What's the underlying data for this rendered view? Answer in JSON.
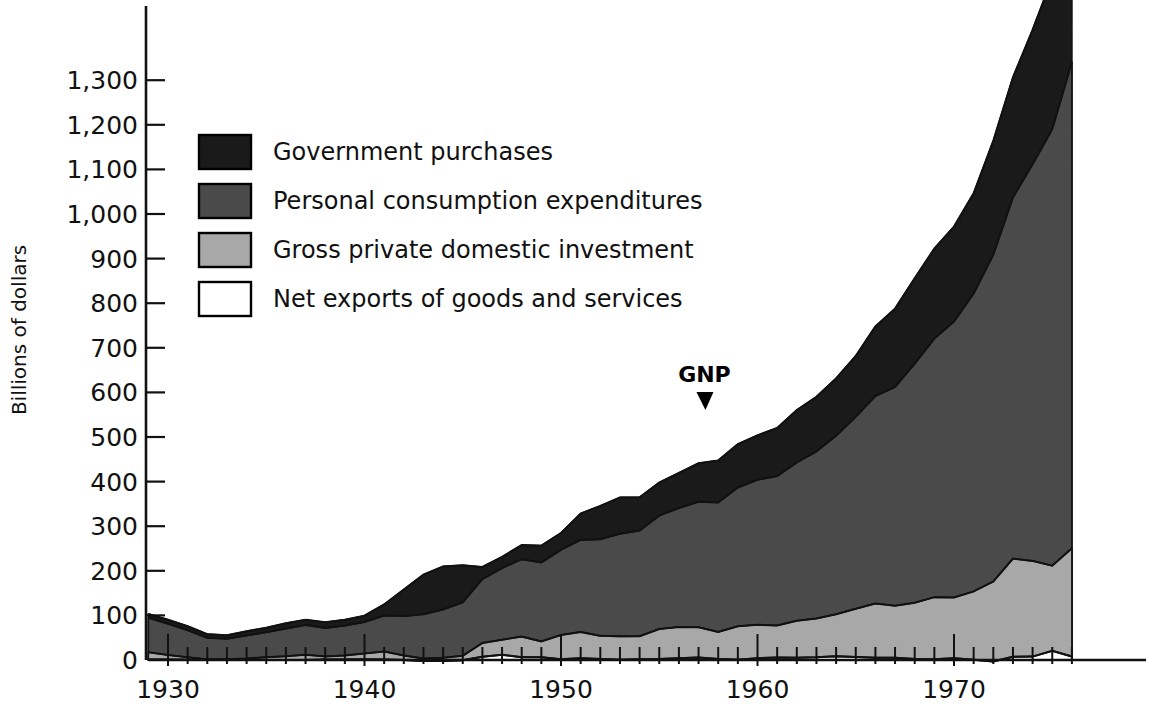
{
  "chart_data": {
    "type": "area",
    "stacked": true,
    "title": "",
    "xlabel": "",
    "ylabel": "Billions of dollars",
    "xlim": [
      1929,
      1976
    ],
    "ylim": [
      0,
      1400
    ],
    "grid": false,
    "legend_position": "upper-left-inside",
    "y_ticks": [
      0,
      100,
      200,
      300,
      400,
      500,
      600,
      700,
      800,
      900,
      1000,
      1100,
      1200,
      1300
    ],
    "y_tick_labels": [
      "0",
      "100",
      "200",
      "300",
      "400",
      "500",
      "600",
      "700",
      "800",
      "900",
      "1,000",
      "1,100",
      "1,200",
      "1,300"
    ],
    "x_ticks": [
      1930,
      1940,
      1950,
      1960,
      1970
    ],
    "x_tick_labels": [
      "1930",
      "1940",
      "1950",
      "1960",
      "1970"
    ],
    "x_minor_tick_interval": 1,
    "x": [
      1929,
      1930,
      1931,
      1932,
      1933,
      1934,
      1935,
      1936,
      1937,
      1938,
      1939,
      1940,
      1941,
      1942,
      1943,
      1944,
      1945,
      1946,
      1947,
      1948,
      1949,
      1950,
      1951,
      1952,
      1953,
      1954,
      1955,
      1956,
      1957,
      1958,
      1959,
      1960,
      1961,
      1962,
      1963,
      1964,
      1965,
      1966,
      1967,
      1968,
      1969,
      1970,
      1971,
      1972,
      1973,
      1974,
      1975,
      1976
    ],
    "series": [
      {
        "name": "Net exports of goods and services",
        "swatch": "#ffffff",
        "stack_order": 1,
        "values": [
          1.1,
          1.0,
          0.5,
          0.4,
          0.4,
          0.6,
          0.1,
          0.1,
          0.1,
          1.1,
          1.0,
          1.5,
          1.0,
          0.0,
          -2.2,
          -2.0,
          -0.8,
          7.5,
          11.5,
          6.4,
          6.1,
          1.8,
          3.7,
          2.2,
          0.4,
          1.8,
          2.0,
          4.0,
          5.7,
          2.2,
          0.3,
          4.1,
          5.6,
          5.1,
          5.9,
          8.5,
          6.9,
          5.3,
          5.2,
          2.5,
          1.9,
          3.9,
          0.6,
          -3.4,
          7.1,
          7.6,
          20.4,
          7.8
        ]
      },
      {
        "name": "Gross private domestic investment",
        "swatch": "#a8a8a8",
        "stack_order": 2,
        "values": [
          16.2,
          10.3,
          5.5,
          0.9,
          1.4,
          2.9,
          6.3,
          8.4,
          11.7,
          6.7,
          9.3,
          13.1,
          18.1,
          9.9,
          5.6,
          7.1,
          10.4,
          30.6,
          34.0,
          46.0,
          35.7,
          54.1,
          59.3,
          51.9,
          52.6,
          51.7,
          67.4,
          70.0,
          67.8,
          60.9,
          75.3,
          74.8,
          71.7,
          83.0,
          87.1,
          94.0,
          108.1,
          121.4,
          116.6,
          126.0,
          139.0,
          136.3,
          153.2,
          179.3,
          220.2,
          214.6,
          190.9,
          243.0
        ]
      },
      {
        "name": "Personal consumption expenditures",
        "swatch": "#4a4a4a",
        "stack_order": 3,
        "values": [
          77.2,
          69.9,
          60.5,
          48.6,
          45.8,
          51.3,
          55.7,
          61.9,
          66.5,
          63.9,
          66.8,
          70.8,
          80.6,
          88.5,
          99.3,
          108.3,
          119.7,
          143.4,
          160.7,
          173.6,
          176.8,
          191.0,
          206.3,
          216.7,
          230.0,
          236.5,
          254.4,
          266.7,
          281.4,
          290.1,
          311.2,
          325.2,
          335.2,
          355.1,
          374.6,
          400.5,
          430.4,
          465.1,
          490.4,
          535.9,
          579.7,
          618.8,
          668.2,
          733.0,
          809.9,
          889.6,
          979.1,
          1090.2
        ]
      },
      {
        "name": "Government purchases",
        "swatch": "#1a1a1a",
        "stack_order": 4,
        "values": [
          8.5,
          9.2,
          9.2,
          8.1,
          8.0,
          9.8,
          10.0,
          12.0,
          11.9,
          13.0,
          13.3,
          14.0,
          24.8,
          59.6,
          88.6,
          96.5,
          82.9,
          27.0,
          25.1,
          31.6,
          37.8,
          37.9,
          59.1,
          74.7,
          81.6,
          74.8,
          74.2,
          78.6,
          86.1,
          94.2,
          97.0,
          99.6,
          107.6,
          117.1,
          122.5,
          128.3,
          136.3,
          155.9,
          175.6,
          191.5,
          201.8,
          212.7,
          224.3,
          255.0,
          269.0,
          301.1,
          338.4,
          361.4
        ]
      }
    ],
    "annotations": [
      {
        "text": "GNP",
        "x": 1957.3,
        "y": 500,
        "marker": "down-arrow",
        "note": "points to top of stacked total (gross national product)"
      }
    ],
    "total_label": "GNP",
    "note": "Stacked areas sum to Gross National Product; order bottom-to-top is net exports, gross private domestic investment, personal consumption expenditures, government purchases."
  },
  "legend": {
    "items": [
      {
        "label": "Government purchases",
        "color": "#1a1a1a",
        "border": "#000000"
      },
      {
        "label": "Personal consumption expenditures",
        "color": "#4a4a4a",
        "border": "#000000"
      },
      {
        "label": "Gross private domestic investment",
        "color": "#a8a8a8",
        "border": "#000000"
      },
      {
        "label": "Net exports of goods and services",
        "color": "#ffffff",
        "border": "#000000"
      }
    ]
  },
  "axis": {
    "y_title": "Billions of dollars"
  },
  "colors": {
    "government": "#1a1a1a",
    "consumption": "#4a4a4a",
    "investment": "#a8a8a8",
    "net_exports": "#ffffff",
    "axis": "#111111",
    "background": "#ffffff"
  }
}
